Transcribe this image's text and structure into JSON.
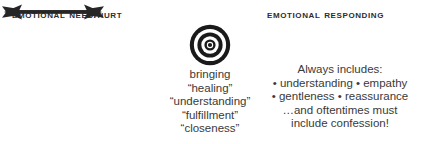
{
  "canvas": {
    "width": 424,
    "height": 144,
    "background": "#ffffff"
  },
  "colors": {
    "ink": "#2d2d2d",
    "body_text": "#3a3a3a",
    "ring": "#1a1a1a",
    "ring_gap": "#ffffff",
    "arrow": "#262626"
  },
  "headings": {
    "left": "Emotional Need/Hurt",
    "right": "Emotional Responding"
  },
  "target": {
    "label": "bullseye-target",
    "rings": 3,
    "center_dot": true
  },
  "arrows": {
    "left": {
      "label": "arrow-pointing-right",
      "direction": "right"
    },
    "right": {
      "label": "arrow-pointing-left",
      "direction": "left"
    }
  },
  "text_left": {
    "lines": [
      "bringing",
      "“healing”",
      "“understanding”",
      "“fulfillment”",
      "“closeness”"
    ]
  },
  "text_right": {
    "lines": [
      "Always includes:",
      "• understanding  • empathy",
      "• gentleness  • reassurance",
      "…and oftentimes must",
      "include confession!"
    ]
  }
}
